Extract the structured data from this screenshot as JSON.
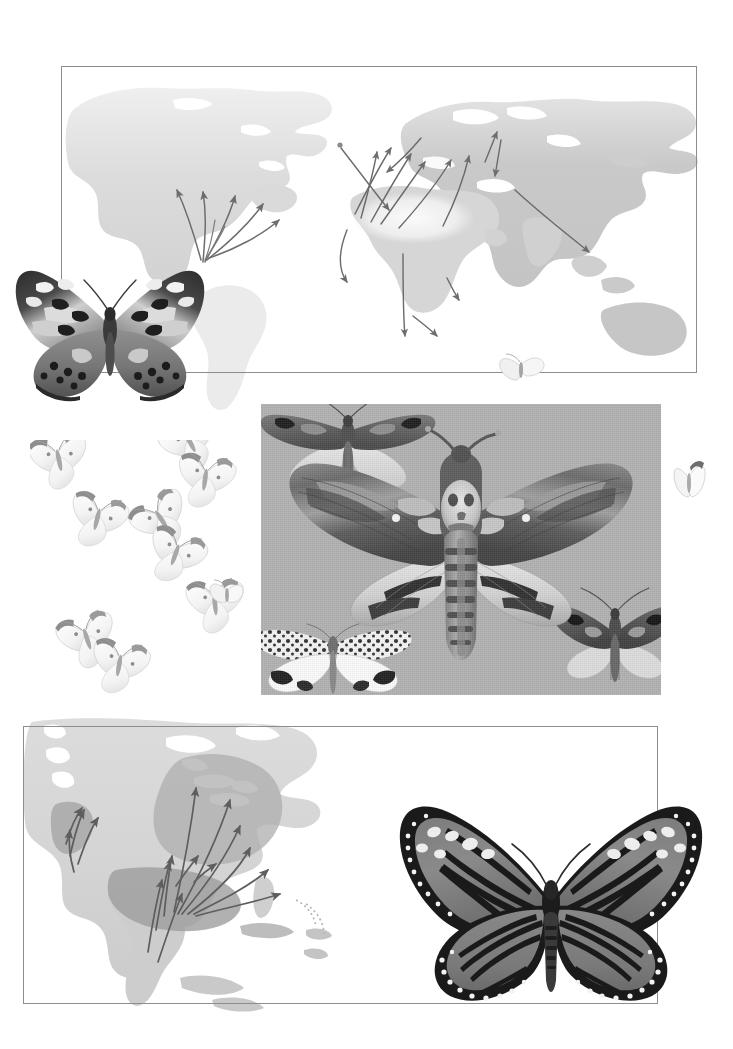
{
  "page": {
    "kind": "illustrated-plate-page",
    "background_color": "#ffffff",
    "width": 733,
    "height": 1049,
    "visible_text": []
  },
  "palette": {
    "frame_line": "#8d8d8d",
    "plate_background": "#b1b1b1",
    "landmass_pale": "#e6e6e6",
    "landmass_mid": "#cfcfcf",
    "landmass_dark": "#b8b8b8",
    "range_overlay": "#a9a9a9",
    "arrow_stroke": "#6f6f6f",
    "arrow_stroke_dark": "#5a5a5a",
    "specimen_dark": "#2a2a2a",
    "specimen_mid": "#6b6b6b",
    "specimen_light": "#d8d8d8"
  },
  "panels": [
    {
      "id": "world-map-panel",
      "name": "world-migration-map",
      "caption": "",
      "frame": {
        "x": 61,
        "y": 66,
        "w": 636,
        "h": 307
      },
      "subject": "Painted Lady world migration routes",
      "continents": [
        "North America",
        "South America",
        "Europe",
        "Africa",
        "Asia",
        "Australia"
      ],
      "arrow_count": 22
    },
    {
      "id": "na-map-panel",
      "name": "north-america-migration-map",
      "caption": "",
      "frame": {
        "x": 23,
        "y": 726,
        "w": 635,
        "h": 278
      },
      "subject": "Monarch butterfly North American migration routes",
      "continents": [
        "North America",
        "Central America",
        "Caribbean"
      ],
      "arrow_count": 16,
      "overwintering_regions": [
        "Central Mexico",
        "Coastal California"
      ]
    },
    {
      "id": "moth-plate",
      "name": "moth-specimen-plate",
      "caption": "",
      "frame": {
        "x": 261,
        "y": 404,
        "w": 400,
        "h": 291
      },
      "background_color": "#b1b1b1",
      "specimens": [
        {
          "name": "deaths-head-hawkmoth",
          "position": "center"
        },
        {
          "name": "noctuid-moth-upper",
          "position": "top-left"
        },
        {
          "name": "tiger-moth-spotted",
          "position": "bottom-left"
        },
        {
          "name": "noctuid-moth-lower",
          "position": "bottom-right"
        }
      ]
    }
  ],
  "specimens": [
    {
      "id": "painted-lady",
      "name": "painted-lady-butterfly",
      "common_name": "Painted Lady",
      "position": {
        "x": 6,
        "y": 250,
        "w": 208,
        "h": 156
      },
      "wing_pattern": "mottled dark-and-pale forewings with black marginal spots"
    },
    {
      "id": "monarch",
      "name": "monarch-butterfly",
      "common_name": "Monarch",
      "position": {
        "x": 392,
        "y": 794,
        "w": 318,
        "h": 222
      },
      "wing_pattern": "dark-veined wings with black borders and white marginal dots"
    }
  ],
  "swarm": {
    "name": "white-butterfly-swarm",
    "common_name": "Cabbage White",
    "count": 9,
    "position": {
      "x": 30,
      "y": 440,
      "w": 240,
      "h": 255
    },
    "strays": [
      {
        "name": "stray-top-edge",
        "x": 496,
        "y": 352
      },
      {
        "name": "stray-right",
        "x": 672,
        "y": 459
      },
      {
        "name": "stray-mid",
        "x": 208,
        "y": 578
      }
    ]
  },
  "chart_data": {
    "type": "map",
    "title": "",
    "maps": [
      {
        "id": "world-migration-map",
        "projection": "equirectangular-world",
        "routes": [
          {
            "from": "Gulf of Mexico",
            "to": "Central USA",
            "direction": "north"
          },
          {
            "from": "Gulf of Mexico",
            "to": "Midwest USA",
            "direction": "north"
          },
          {
            "from": "Gulf of Mexico",
            "to": "Great Lakes",
            "direction": "north"
          },
          {
            "from": "Gulf of Mexico",
            "to": "Northeast USA",
            "direction": "northeast"
          },
          {
            "from": "Gulf of Mexico",
            "to": "Atlantic Canada",
            "direction": "northeast"
          },
          {
            "from": "North Africa",
            "to": "Iberia",
            "direction": "north"
          },
          {
            "from": "North Africa",
            "to": "France",
            "direction": "north"
          },
          {
            "from": "North Africa",
            "to": "Britain",
            "direction": "north"
          },
          {
            "from": "North Africa",
            "to": "Scandinavia",
            "direction": "north"
          },
          {
            "from": "Middle East",
            "to": "Eastern Europe",
            "direction": "north"
          },
          {
            "from": "Middle East",
            "to": "Central Asia",
            "direction": "northeast"
          },
          {
            "from": "Central Asia",
            "to": "Siberia",
            "direction": "north"
          },
          {
            "from": "Atlantic islands",
            "to": "Western Europe",
            "direction": "northeast"
          },
          {
            "from": "Sahel",
            "to": "Southern Africa",
            "direction": "south"
          },
          {
            "from": "India",
            "to": "Southeast Asia",
            "direction": "southeast"
          }
        ]
      },
      {
        "id": "north-america-migration-map",
        "projection": "north-america",
        "routes": [
          {
            "from": "Central Mexico",
            "to": "Texas",
            "direction": "north"
          },
          {
            "from": "Central Mexico",
            "to": "Great Plains",
            "direction": "north"
          },
          {
            "from": "Gulf Coast",
            "to": "Midwest",
            "direction": "north"
          },
          {
            "from": "Gulf Coast",
            "to": "Great Lakes",
            "direction": "north"
          },
          {
            "from": "Gulf Coast",
            "to": "Ontario",
            "direction": "north"
          },
          {
            "from": "Gulf Coast",
            "to": "Northeast USA",
            "direction": "northeast"
          },
          {
            "from": "Coastal California",
            "to": "Pacific Northwest",
            "direction": "north"
          },
          {
            "from": "Coastal California",
            "to": "Great Basin",
            "direction": "northeast"
          }
        ]
      }
    ]
  }
}
